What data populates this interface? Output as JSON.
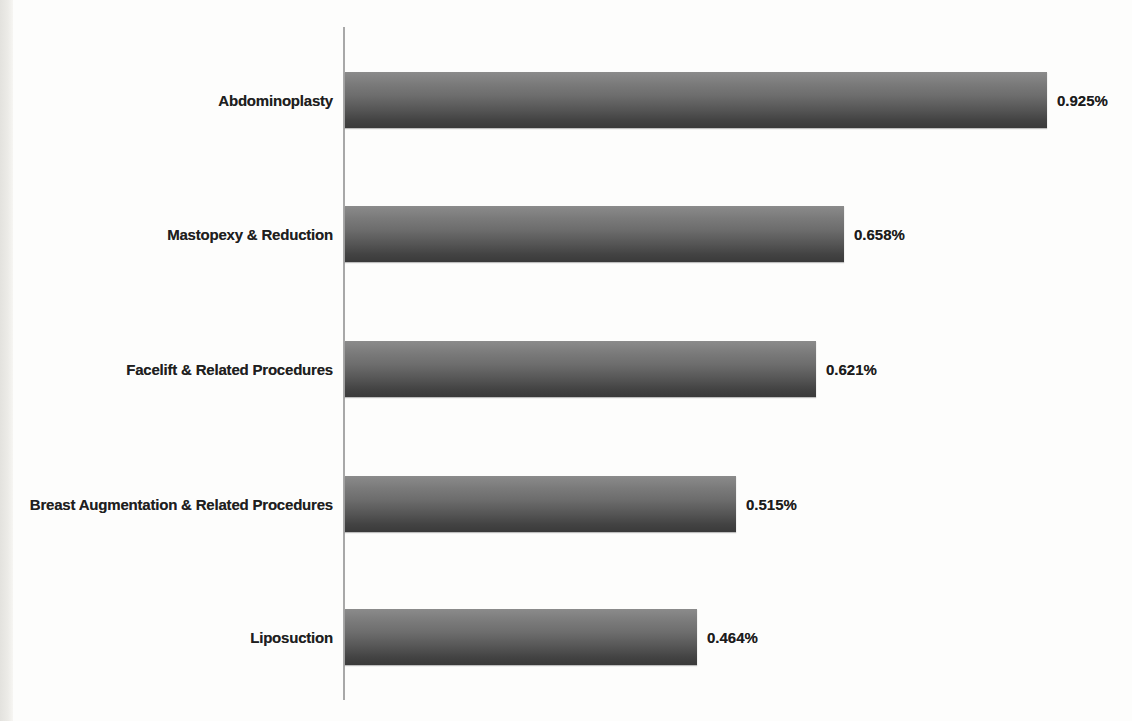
{
  "chart_data": {
    "type": "bar",
    "orientation": "horizontal",
    "title": "",
    "xlabel": "",
    "ylabel": "",
    "grid": false,
    "legend": null,
    "xlim": [
      0,
      1.0
    ],
    "categories": [
      "Abdominoplasty",
      "Mastopexy & Reduction",
      "Facelift & Related Procedures",
      "Breast Augmentation & Related Procedures",
      "Liposuction"
    ],
    "values": [
      0.925,
      0.658,
      0.621,
      0.515,
      0.464
    ],
    "value_labels": [
      "0.925%",
      "0.658%",
      "0.621%",
      "0.515%",
      "0.464%"
    ],
    "colors": {
      "bar_gradient_top": "#8b8b8b",
      "bar_gradient_bottom": "#3a3a3a",
      "axis_line": "#a8a8a8",
      "text": "#1f1f1f",
      "background": "#fdfdfc",
      "page_edge": "#e9e8e4"
    }
  }
}
